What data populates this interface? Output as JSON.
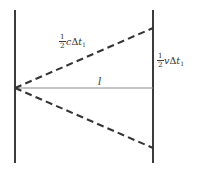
{
  "figure": {
    "background_color": "#ffffff",
    "width": 198,
    "height": 171
  },
  "colors": {
    "mirror_line": "#3c3c3c",
    "dashed_path": "#353535",
    "baseline": "#8c8c8c",
    "text": "#333333"
  },
  "labels": {
    "light_path": {
      "numerator": "1",
      "denominator": "2",
      "symbol": "c",
      "delta": "Δ",
      "time_var": "t",
      "time_subscript": "1",
      "plain_text": "1/2 cΔt₁"
    },
    "displacement": {
      "numerator": "1",
      "denominator": "2",
      "symbol": "v",
      "delta": "Δ",
      "time_var": "t",
      "time_subscript": "1",
      "plain_text": "1/2 vΔt₁"
    },
    "length": {
      "symbol": "l",
      "plain_text": "l"
    }
  },
  "geometry": {
    "left_mirror": {
      "x": 15,
      "y_top": 10,
      "y_bottom": 163
    },
    "right_mirror": {
      "x": 153,
      "y_top": 10,
      "y_bottom": 163
    },
    "apex": {
      "x": 15,
      "y": 88
    },
    "baseline": {
      "x1": 15,
      "y1": 88,
      "x2": 153,
      "y2": 88
    },
    "upper_ray": {
      "x1": 15,
      "y1": 88,
      "x2": 153,
      "y2": 28
    },
    "lower_ray": {
      "x1": 15,
      "y1": 88,
      "x2": 153,
      "y2": 148
    },
    "dash_pattern": "7,4",
    "mirror_stroke_width": 2,
    "ray_stroke_width": 2,
    "baseline_stroke_width": 1
  }
}
